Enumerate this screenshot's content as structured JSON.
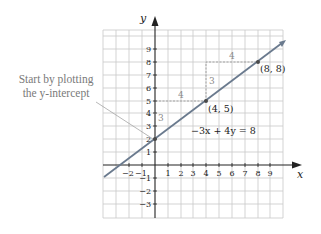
{
  "callout": {
    "line1": "Start by plotting",
    "line2": "the y-intercept"
  },
  "axes": {
    "x_label": "x",
    "y_label": "y",
    "x_ticks": [
      "−2",
      "−1",
      "1",
      "2",
      "3",
      "4",
      "5",
      "6",
      "7",
      "8",
      "9"
    ],
    "y_ticks": [
      "9",
      "8",
      "7",
      "6",
      "5",
      "4",
      "3",
      "2",
      "1",
      "−1",
      "−2",
      "−3"
    ]
  },
  "equation": "−3x + 4y = 8",
  "points": [
    {
      "label": "",
      "x": 0,
      "y": 2
    },
    {
      "label": "(4, 5)",
      "x": 4,
      "y": 5
    },
    {
      "label": "(8, 8)",
      "x": 8,
      "y": 8
    }
  ],
  "slope_labels": {
    "rise1": "3",
    "run1": "4",
    "rise2": "3",
    "run2": "4"
  },
  "colors": {
    "line": "#6a7a8e",
    "grid": "#c8c8c8",
    "axis": "#222222",
    "annotation": "#8a8a8a"
  }
}
